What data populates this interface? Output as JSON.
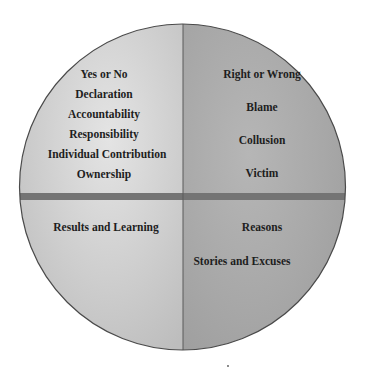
{
  "diagram": {
    "type": "quadrant-circle",
    "colors": {
      "left_half": "#c8c8c8",
      "left_half_highlight": "#e2e2e2",
      "right_half": "#a6a6a6",
      "right_half_highlight": "#b8b8b8",
      "divider_band": "#747474",
      "outline": "#4a4a4a",
      "text": "#1e1e1e"
    },
    "quadrants": {
      "top_left": {
        "items": [
          "Yes or No",
          "Declaration",
          "Accountability",
          "Responsibility",
          "Individual Contribution",
          "Ownership"
        ]
      },
      "top_right": {
        "items": [
          "Right or Wrong",
          "Blame",
          "Collusion",
          "Victim"
        ]
      },
      "bottom_left": {
        "items": [
          "Results and Learning"
        ]
      },
      "bottom_right": {
        "items": [
          "Reasons",
          "Stories and Excuses"
        ]
      }
    }
  }
}
